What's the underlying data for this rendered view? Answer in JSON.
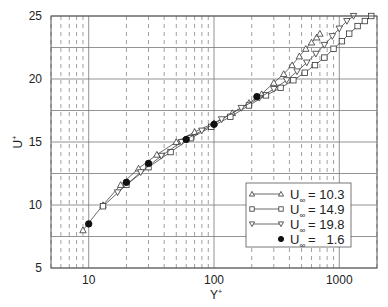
{
  "chart_data": {
    "type": "scatter",
    "title": "",
    "xlabel": "Y+",
    "ylabel": "U+",
    "xscale": "log",
    "xlim": [
      5,
      2000
    ],
    "ylim": [
      5,
      25
    ],
    "xticks": [
      10,
      100,
      1000
    ],
    "xtick_labels": [
      "10",
      "100",
      "1000"
    ],
    "yticks": [
      5,
      10,
      15,
      20,
      25
    ],
    "ytick_labels": [
      "5",
      "10",
      "15",
      "20",
      "25"
    ],
    "grid": {
      "major_y_step": 2.5,
      "minor_x": "dashed",
      "major_x": "solid"
    },
    "legend_position": "lower right",
    "series": [
      {
        "name": "U∞ = 10.3",
        "label_prefix": "U",
        "label_sub": "∞",
        "label_value": "= 10.3",
        "marker": "triangle-up",
        "line": true,
        "x": [
          9,
          13,
          18,
          25,
          35,
          50,
          70,
          100,
          140,
          190,
          240,
          300,
          360,
          420,
          480,
          540,
          600,
          660,
          700
        ],
        "y": [
          8.0,
          10.0,
          11.6,
          12.9,
          14.0,
          15.0,
          15.8,
          16.5,
          17.3,
          18.1,
          18.8,
          19.7,
          20.4,
          21.1,
          21.8,
          22.4,
          22.9,
          23.3,
          23.6
        ]
      },
      {
        "name": "U∞ = 14.9",
        "label_prefix": "U",
        "label_sub": "∞",
        "label_value": "= 14.9",
        "marker": "square",
        "line": true,
        "x": [
          13,
          20,
          30,
          45,
          65,
          95,
          135,
          190,
          260,
          340,
          430,
          530,
          640,
          760,
          900,
          1050,
          1200,
          1400,
          1600,
          1800
        ],
        "y": [
          9.9,
          11.6,
          13.0,
          14.2,
          15.3,
          16.2,
          17.0,
          17.9,
          18.7,
          19.3,
          19.9,
          20.5,
          21.1,
          21.7,
          22.4,
          23.0,
          23.6,
          24.2,
          24.6,
          25.0
        ]
      },
      {
        "name": "U∞ = 19.8",
        "label_prefix": "U",
        "label_sub": "∞",
        "label_value": "= 19.8",
        "marker": "triangle-down",
        "line": true,
        "x": [
          17,
          26,
          38,
          55,
          80,
          115,
          165,
          230,
          300,
          380,
          460,
          550,
          650,
          760,
          880,
          1000,
          1150,
          1300
        ],
        "y": [
          11.0,
          12.6,
          13.9,
          15.0,
          15.9,
          16.8,
          17.7,
          18.5,
          19.2,
          19.9,
          20.6,
          21.3,
          22.0,
          22.7,
          23.4,
          24.0,
          24.6,
          25.0
        ]
      },
      {
        "name": "U∞ = 1.6",
        "label_prefix": "U",
        "label_sub": "∞",
        "label_value": "=   1.6",
        "marker": "circle-filled",
        "line": false,
        "x": [
          10,
          20,
          30,
          60,
          100,
          220
        ],
        "y": [
          8.5,
          11.8,
          13.3,
          15.2,
          16.4,
          18.6
        ]
      }
    ]
  },
  "axes": {
    "x_label": "Y",
    "x_label_sup": "+",
    "y_label": "U",
    "y_label_sup": "+"
  },
  "layout": {
    "plot": {
      "left": 51,
      "top": 16,
      "right": 377,
      "bottom": 268
    },
    "colors": {
      "axis": "#555555",
      "grid": "#777777",
      "marker": "#333333",
      "background": "#ffffff"
    }
  }
}
